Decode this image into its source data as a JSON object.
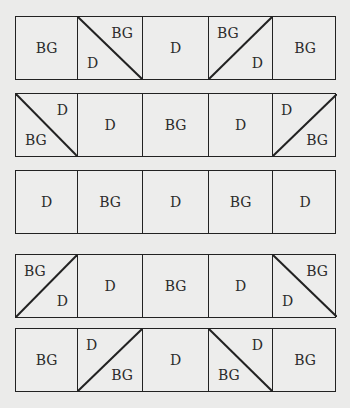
{
  "diagram": {
    "type": "quilt-block-layout",
    "legend_terms": [
      "BG",
      "D"
    ],
    "line_color": "#222222",
    "background_color": "#ebebea",
    "rows": [
      {
        "cells": [
          {
            "type": "solid",
            "label": "BG"
          },
          {
            "type": "split",
            "diagonal": "tl-br",
            "top_label": "BG",
            "top_pos": "tr",
            "bottom_label": "D",
            "bottom_pos": "bl"
          },
          {
            "type": "solid",
            "label": "D"
          },
          {
            "type": "split",
            "diagonal": "bl-tr",
            "top_label": "BG",
            "top_pos": "tl",
            "bottom_label": "D",
            "bottom_pos": "br"
          },
          {
            "type": "solid",
            "label": "BG"
          }
        ]
      },
      {
        "cells": [
          {
            "type": "split",
            "diagonal": "tl-br",
            "top_label": "D",
            "top_pos": "tr",
            "bottom_label": "BG",
            "bottom_pos": "bl"
          },
          {
            "type": "solid",
            "label": "D"
          },
          {
            "type": "solid",
            "label": "BG"
          },
          {
            "type": "solid",
            "label": "D"
          },
          {
            "type": "split",
            "diagonal": "bl-tr",
            "top_label": "D",
            "top_pos": "tl",
            "bottom_label": "BG",
            "bottom_pos": "br"
          }
        ]
      },
      {
        "cells": [
          {
            "type": "solid",
            "label": "D"
          },
          {
            "type": "solid",
            "label": "BG"
          },
          {
            "type": "solid",
            "label": "D"
          },
          {
            "type": "solid",
            "label": "BG"
          },
          {
            "type": "solid",
            "label": "D"
          }
        ]
      },
      {
        "cells": [
          {
            "type": "split",
            "diagonal": "bl-tr",
            "top_label": "BG",
            "top_pos": "tl",
            "bottom_label": "D",
            "bottom_pos": "br"
          },
          {
            "type": "solid",
            "label": "D"
          },
          {
            "type": "solid",
            "label": "BG"
          },
          {
            "type": "solid",
            "label": "D"
          },
          {
            "type": "split",
            "diagonal": "tl-br",
            "top_label": "BG",
            "top_pos": "tr",
            "bottom_label": "D",
            "bottom_pos": "bl"
          }
        ]
      },
      {
        "cells": [
          {
            "type": "solid",
            "label": "BG"
          },
          {
            "type": "split",
            "diagonal": "bl-tr",
            "top_label": "D",
            "top_pos": "tl",
            "bottom_label": "BG",
            "bottom_pos": "br"
          },
          {
            "type": "solid",
            "label": "D"
          },
          {
            "type": "split",
            "diagonal": "tl-br",
            "top_label": "D",
            "top_pos": "tr",
            "bottom_label": "BG",
            "bottom_pos": "bl"
          },
          {
            "type": "solid",
            "label": "BG"
          }
        ]
      }
    ]
  }
}
